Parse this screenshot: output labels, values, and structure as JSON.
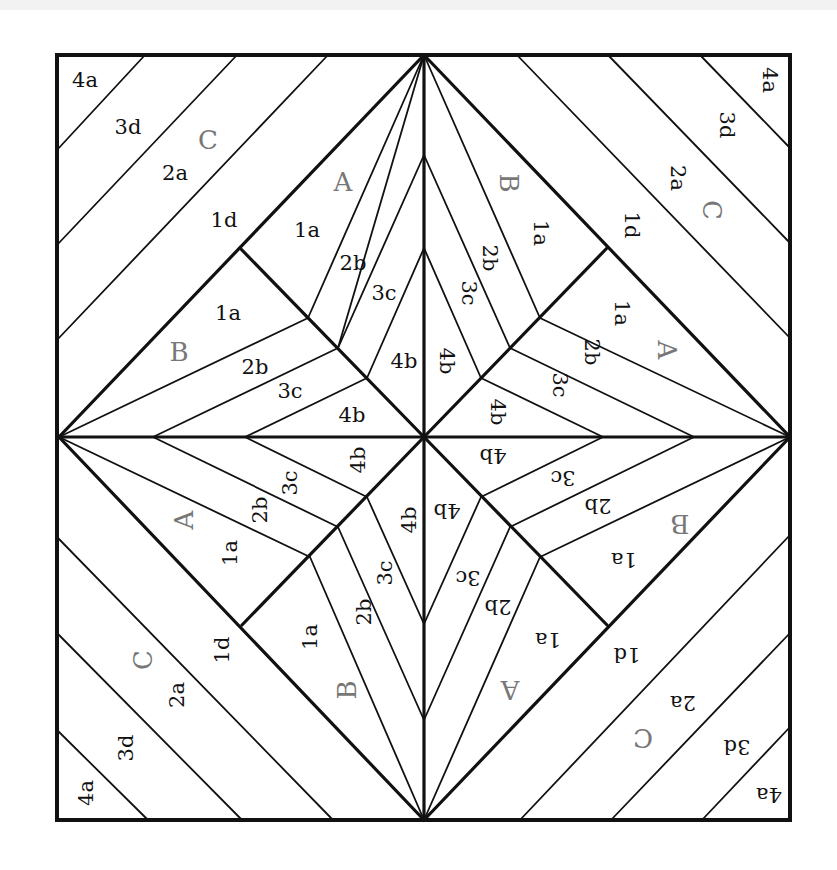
{
  "colors": {
    "line": "#111111",
    "section_letter": "#777777",
    "piece_number": "#111111",
    "background": "#ffffff"
  },
  "frame": {
    "x1": 57,
    "y1": 55,
    "x2": 790,
    "y2": 820
  },
  "center": {
    "x": 424,
    "y": 437
  },
  "sections": [
    "A",
    "B",
    "C"
  ],
  "quadrants": [
    {
      "name": "top-left",
      "rotation": 0,
      "labels": [
        {
          "text": "4a",
          "x": 85,
          "y": 80,
          "kind": "piece"
        },
        {
          "text": "3d",
          "x": 128,
          "y": 127,
          "kind": "piece"
        },
        {
          "text": "C",
          "x": 208,
          "y": 140,
          "kind": "section"
        },
        {
          "text": "2a",
          "x": 175,
          "y": 173,
          "kind": "piece"
        },
        {
          "text": "1d",
          "x": 224,
          "y": 220,
          "kind": "piece"
        },
        {
          "text": "A",
          "x": 343,
          "y": 182,
          "kind": "section"
        },
        {
          "text": "1a",
          "x": 307,
          "y": 230,
          "kind": "piece"
        },
        {
          "text": "2b",
          "x": 353,
          "y": 263,
          "kind": "piece"
        },
        {
          "text": "3c",
          "x": 384,
          "y": 293,
          "kind": "piece"
        },
        {
          "text": "4b",
          "x": 404,
          "y": 361,
          "kind": "piece"
        },
        {
          "text": "1a",
          "x": 228,
          "y": 313,
          "kind": "piece"
        },
        {
          "text": "B",
          "x": 179,
          "y": 352,
          "kind": "section"
        },
        {
          "text": "2b",
          "x": 255,
          "y": 367,
          "kind": "piece"
        },
        {
          "text": "3c",
          "x": 290,
          "y": 391,
          "kind": "piece"
        },
        {
          "text": "4b",
          "x": 352,
          "y": 415,
          "kind": "piece"
        }
      ]
    },
    {
      "name": "top-right",
      "rotation": 90,
      "labels": [
        {
          "text": "4a",
          "x": 770,
          "y": 80,
          "kind": "piece"
        },
        {
          "text": "3d",
          "x": 727,
          "y": 125,
          "kind": "piece"
        },
        {
          "text": "2a",
          "x": 678,
          "y": 178,
          "kind": "piece"
        },
        {
          "text": "C",
          "x": 712,
          "y": 210,
          "kind": "section"
        },
        {
          "text": "1d",
          "x": 632,
          "y": 225,
          "kind": "piece"
        },
        {
          "text": "B",
          "x": 509,
          "y": 183,
          "kind": "section"
        },
        {
          "text": "1a",
          "x": 541,
          "y": 233,
          "kind": "piece"
        },
        {
          "text": "2b",
          "x": 490,
          "y": 258,
          "kind": "piece"
        },
        {
          "text": "3c",
          "x": 469,
          "y": 293,
          "kind": "piece"
        },
        {
          "text": "4b",
          "x": 447,
          "y": 361,
          "kind": "piece"
        },
        {
          "text": "1a",
          "x": 622,
          "y": 313,
          "kind": "piece"
        },
        {
          "text": "A",
          "x": 667,
          "y": 350,
          "kind": "section"
        },
        {
          "text": "2b",
          "x": 592,
          "y": 352,
          "kind": "piece"
        },
        {
          "text": "3c",
          "x": 560,
          "y": 385,
          "kind": "piece"
        },
        {
          "text": "4b",
          "x": 498,
          "y": 412,
          "kind": "piece"
        }
      ]
    },
    {
      "name": "bottom-left",
      "rotation": -90,
      "labels": [
        {
          "text": "4a",
          "x": 86,
          "y": 793,
          "kind": "piece"
        },
        {
          "text": "3d",
          "x": 126,
          "y": 748,
          "kind": "piece"
        },
        {
          "text": "2a",
          "x": 177,
          "y": 695,
          "kind": "piece"
        },
        {
          "text": "C",
          "x": 143,
          "y": 660,
          "kind": "section"
        },
        {
          "text": "1d",
          "x": 222,
          "y": 650,
          "kind": "piece"
        },
        {
          "text": "B",
          "x": 347,
          "y": 690,
          "kind": "section"
        },
        {
          "text": "1a",
          "x": 310,
          "y": 637,
          "kind": "piece"
        },
        {
          "text": "2b",
          "x": 364,
          "y": 612,
          "kind": "piece"
        },
        {
          "text": "3c",
          "x": 385,
          "y": 573,
          "kind": "piece"
        },
        {
          "text": "4b",
          "x": 409,
          "y": 520,
          "kind": "piece"
        },
        {
          "text": "1a",
          "x": 230,
          "y": 553,
          "kind": "piece"
        },
        {
          "text": "A",
          "x": 184,
          "y": 520,
          "kind": "section"
        },
        {
          "text": "2b",
          "x": 260,
          "y": 510,
          "kind": "piece"
        },
        {
          "text": "3c",
          "x": 290,
          "y": 483,
          "kind": "piece"
        },
        {
          "text": "4b",
          "x": 358,
          "y": 460,
          "kind": "piece"
        }
      ]
    },
    {
      "name": "bottom-right",
      "rotation": 180,
      "labels": [
        {
          "text": "4a",
          "x": 769,
          "y": 795,
          "kind": "piece"
        },
        {
          "text": "3d",
          "x": 737,
          "y": 747,
          "kind": "piece"
        },
        {
          "text": "2a",
          "x": 683,
          "y": 703,
          "kind": "piece"
        },
        {
          "text": "C",
          "x": 643,
          "y": 738,
          "kind": "section"
        },
        {
          "text": "1d",
          "x": 627,
          "y": 655,
          "kind": "piece"
        },
        {
          "text": "A",
          "x": 510,
          "y": 690,
          "kind": "section"
        },
        {
          "text": "1a",
          "x": 548,
          "y": 640,
          "kind": "piece"
        },
        {
          "text": "2b",
          "x": 498,
          "y": 607,
          "kind": "piece"
        },
        {
          "text": "3c",
          "x": 468,
          "y": 578,
          "kind": "piece"
        },
        {
          "text": "4b",
          "x": 447,
          "y": 511,
          "kind": "piece"
        },
        {
          "text": "1a",
          "x": 624,
          "y": 560,
          "kind": "piece"
        },
        {
          "text": "B",
          "x": 680,
          "y": 524,
          "kind": "section"
        },
        {
          "text": "2b",
          "x": 598,
          "y": 506,
          "kind": "piece"
        },
        {
          "text": "3c",
          "x": 563,
          "y": 478,
          "kind": "piece"
        },
        {
          "text": "4b",
          "x": 493,
          "y": 456,
          "kind": "piece"
        }
      ]
    }
  ]
}
